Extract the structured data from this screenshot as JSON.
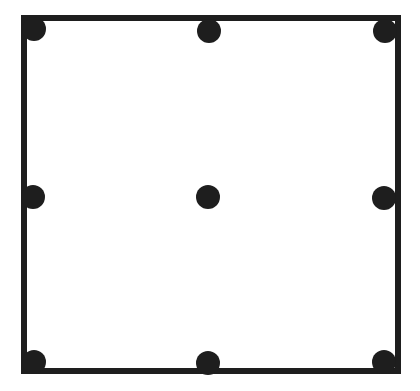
{
  "diagram": {
    "type": "square-with-dots",
    "colors": {
      "stroke": "#1e1e1e",
      "background": "#ffffff"
    },
    "square": {
      "x": 24,
      "y": 18,
      "width": 374,
      "height": 353,
      "stroke_width": 6
    },
    "dots": [
      {
        "id": "top-left",
        "cx": 34,
        "cy": 29
      },
      {
        "id": "top-middle",
        "cx": 209,
        "cy": 31
      },
      {
        "id": "top-right",
        "cx": 385,
        "cy": 31
      },
      {
        "id": "middle-left",
        "cx": 33,
        "cy": 197
      },
      {
        "id": "center",
        "cx": 208,
        "cy": 197
      },
      {
        "id": "middle-right",
        "cx": 384,
        "cy": 198
      },
      {
        "id": "bottom-left",
        "cx": 34,
        "cy": 362
      },
      {
        "id": "bottom-middle",
        "cx": 208,
        "cy": 363
      },
      {
        "id": "bottom-right",
        "cx": 384,
        "cy": 362
      }
    ],
    "dot_radius": 12
  }
}
